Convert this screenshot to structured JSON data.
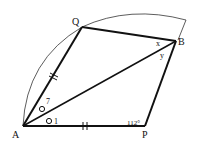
{
  "diagram": {
    "points": {
      "A": {
        "label": "A",
        "x": 23,
        "y": 126
      },
      "Q": {
        "label": "Q",
        "x": 82,
        "y": 27
      },
      "B": {
        "label": "B",
        "x": 176,
        "y": 41
      },
      "P": {
        "label": "P",
        "x": 145,
        "y": 126
      }
    },
    "angle_labels": {
      "P": "112°",
      "QBA": "x",
      "ABP": "y",
      "QAB_mark": "o",
      "QAB_label": "7",
      "BAP_mark": "o",
      "BAP_label": "1"
    },
    "tick_marks": {
      "AQ": "||",
      "AP": "||"
    },
    "colors": {
      "line": "#111111",
      "background": "#ffffff"
    }
  }
}
